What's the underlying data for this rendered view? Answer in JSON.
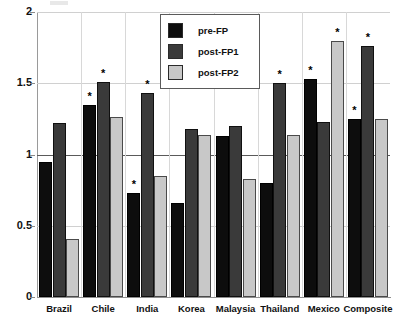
{
  "chart_data": {
    "type": "bar",
    "title": "",
    "subtitle": "",
    "xlabel": "",
    "ylabel": "",
    "ylim": [
      0,
      2
    ],
    "yticks": [
      "0",
      "0.5",
      "1",
      "1.5",
      "2"
    ],
    "ytick_values": [
      0,
      0.5,
      1,
      1.5,
      2
    ],
    "grid": true,
    "reference_line": 1,
    "legend_position": "top-center",
    "categories": [
      "Brazil",
      "Chile",
      "India",
      "Korea",
      "Malaysia",
      "Thailand",
      "Mexico",
      "Composite"
    ],
    "series": [
      {
        "name": "pre-FP",
        "color": "#0d0d0d",
        "values": [
          0.95,
          1.35,
          0.73,
          0.66,
          1.13,
          0.8,
          1.53,
          1.25
        ],
        "significant": [
          false,
          true,
          true,
          false,
          false,
          false,
          true,
          true
        ]
      },
      {
        "name": "post-FP1",
        "color": "#3a3a3a",
        "values": [
          1.22,
          1.51,
          1.43,
          1.18,
          1.2,
          1.5,
          1.23,
          1.76
        ],
        "significant": [
          false,
          true,
          true,
          false,
          false,
          true,
          false,
          true
        ]
      },
      {
        "name": "post-FP2",
        "color": "#c8c8c8",
        "values": [
          0.41,
          1.26,
          0.85,
          1.14,
          0.83,
          1.14,
          1.8,
          1.25
        ],
        "significant": [
          false,
          false,
          false,
          false,
          false,
          false,
          true,
          false
        ]
      }
    ],
    "significance_marker": "*"
  },
  "legend": {
    "entries": [
      {
        "label": "pre-FP",
        "color": "#0d0d0d"
      },
      {
        "label": "post-FP1",
        "color": "#3a3a3a"
      },
      {
        "label": "post-FP2",
        "color": "#c8c8c8"
      }
    ]
  },
  "axes": {
    "y_tick_labels": [
      "2",
      "1.5",
      "1",
      "0.5",
      "0"
    ],
    "x_tick_labels": [
      "Brazil",
      "Chile",
      "India",
      "Korea",
      "Malaysia",
      "Thailand",
      "Mexico",
      "Composite"
    ]
  },
  "colors": {
    "series_pre_fp": "#0d0d0d",
    "series_post_fp1": "#3a3a3a",
    "series_post_fp2": "#c8c8c8",
    "gridline": "#d0d0d0",
    "reference_line": "#5a5a5a",
    "axis": "#8f8f8f",
    "text": "#111111",
    "background": "#ffffff"
  }
}
